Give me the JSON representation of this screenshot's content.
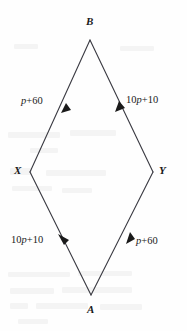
{
  "figure": {
    "type": "geometry-diagram",
    "shape": "rhombus",
    "stroke_color": "#3a3a42",
    "text_color": "#1a1a1a",
    "background_color": "#fefefe",
    "vertices": [
      {
        "id": "B",
        "label": "B",
        "x": 90,
        "y": 40,
        "label_x": 86,
        "label_y": 18
      },
      {
        "id": "X",
        "label": "X",
        "x": 30,
        "y": 172,
        "label_x": 15,
        "label_y": 166
      },
      {
        "id": "Y",
        "label": "Y",
        "x": 153,
        "y": 172,
        "label_x": 159,
        "label_y": 166
      },
      {
        "id": "A",
        "label": "A",
        "x": 91,
        "y": 295,
        "label_x": 87,
        "label_y": 306
      }
    ],
    "edges": [
      {
        "id": "edge-x-b",
        "from": "X",
        "to": "B",
        "label": "p+60",
        "label_coefficient": "",
        "label_variable": "p",
        "label_constant": "60",
        "arrow_direction": "toward-B",
        "label_x": 21,
        "label_y": 96
      },
      {
        "id": "edge-y-b",
        "from": "Y",
        "to": "B",
        "label": "10p+10",
        "label_coefficient": "10",
        "label_variable": "p",
        "label_constant": "10",
        "arrow_direction": "toward-B",
        "label_x": 126,
        "label_y": 95
      },
      {
        "id": "edge-a-x",
        "from": "A",
        "to": "X",
        "label": "10p+10",
        "label_coefficient": "10",
        "label_variable": "p",
        "label_constant": "10",
        "arrow_direction": "toward-X",
        "label_x": 11,
        "label_y": 235
      },
      {
        "id": "edge-a-y",
        "from": "A",
        "to": "Y",
        "label": "p+60",
        "label_coefficient": "",
        "label_variable": "p",
        "label_constant": "60",
        "arrow_direction": "toward-Y",
        "label_x": 135,
        "label_y": 236
      }
    ]
  }
}
